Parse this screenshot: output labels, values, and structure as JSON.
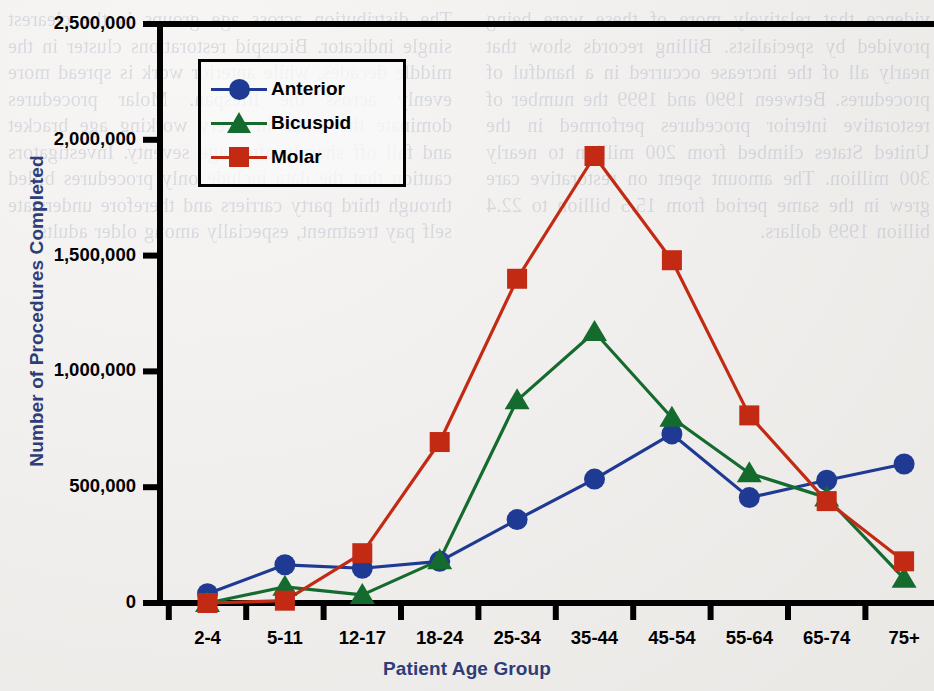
{
  "background_text": "vidence that relatively more of these were being provided by specialists. Billing records show that nearly all of the increase occurred in a handful of procedures. Between 1990 and 1999 the number of restorative interior procedures performed in the United States climbed from 200 million to nearly 300 million. The amount spent on restorative care grew in the same period from 15.5 billion to 22.4 billion 1999 dollars.\n\nThe distribution across age groups is the clearest single indicator. Bicuspid restorations cluster in the middle decades, while anterior work is spread more evenly across the lifespan. Molar procedures dominate the totals in every working age bracket and fall off sharply after age seventy. Investigators caution that the data include only procedures billed through third party carriers and therefore understate self pay treatment, especially among older adults.",
  "chart_data": {
    "type": "line",
    "title": "",
    "xlabel": "Patient Age Group",
    "ylabel": "Number of Procedures Completed",
    "categories": [
      "2-4",
      "5-11",
      "12-17",
      "18-24",
      "25-34",
      "35-44",
      "45-54",
      "55-64",
      "65-74",
      "75+"
    ],
    "ytick_labels": [
      "2,500,000",
      "2,000,000",
      "1,500,000",
      "1,000,000",
      "500,000",
      "0"
    ],
    "ytick_values": [
      2500000,
      2000000,
      1500000,
      1000000,
      500000,
      0
    ],
    "ylim": [
      0,
      2500000
    ],
    "grid": false,
    "legend_position": "top-left-inside",
    "series": [
      {
        "name": "Anterior",
        "color": "#1f3a93",
        "marker": "circle",
        "values": [
          40000,
          165000,
          150000,
          180000,
          360000,
          535000,
          730000,
          455000,
          530000,
          600000
        ]
      },
      {
        "name": "Bicuspid",
        "color": "#156b2e",
        "marker": "triangle",
        "values": [
          0,
          70000,
          35000,
          185000,
          875000,
          1170000,
          800000,
          560000,
          455000,
          105000
        ]
      },
      {
        "name": "Molar",
        "color": "#c32a14",
        "marker": "square",
        "values": [
          0,
          10000,
          215000,
          695000,
          1400000,
          1930000,
          1480000,
          810000,
          440000,
          180000
        ]
      }
    ]
  },
  "colors": {
    "axis_title": "#2e3d78",
    "axis_line": "#000000",
    "anterior": "#1f3a93",
    "bicuspid": "#156b2e",
    "molar": "#c32a14"
  }
}
